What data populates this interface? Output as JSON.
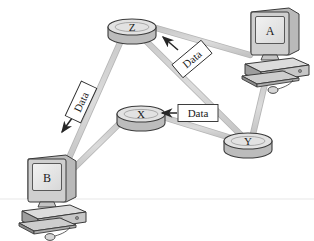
{
  "diagram": {
    "background_color": "#ffffff",
    "link_color": "#d2d2d2",
    "link_edge_color": "#b8b8b8",
    "outline_color": "#3a3a3a",
    "router_top_color": "#e0e0e0",
    "router_body_color": "#bcbcbc",
    "screen_color": "#e8e8e8",
    "case_color": "#d6d6d6",
    "case_shade_color": "#8e8e8e",
    "label_box_fill": "#ffffff",
    "label_text_color": "#1a1a1a",
    "arrow_color": "#262626"
  },
  "nodes": {
    "routers": [
      {
        "id": "router-z",
        "label": "Z",
        "cx": 132,
        "cy": 27,
        "rx": 24,
        "ry": 8,
        "depth": 9
      },
      {
        "id": "router-x",
        "label": "X",
        "cx": 141,
        "cy": 114,
        "rx": 24,
        "ry": 8,
        "depth": 9
      },
      {
        "id": "router-y",
        "label": "Y",
        "cx": 248,
        "cy": 141,
        "rx": 24,
        "ry": 8,
        "depth": 9
      }
    ],
    "computers": [
      {
        "id": "computer-a",
        "label": "A",
        "x": 243,
        "y": 8
      },
      {
        "id": "computer-b",
        "label": "B",
        "x": 20,
        "y": 155
      }
    ]
  },
  "links": [
    {
      "id": "link-z-a",
      "from": "router-z",
      "to": "computer-a",
      "x1": 156,
      "y1": 28,
      "x2": 248,
      "y2": 54
    },
    {
      "id": "link-z-y",
      "from": "router-z",
      "to": "router-y",
      "x1": 140,
      "y1": 36,
      "x2": 242,
      "y2": 137
    },
    {
      "id": "link-z-b",
      "from": "router-z",
      "to": "computer-b",
      "x1": 124,
      "y1": 36,
      "x2": 64,
      "y2": 166
    },
    {
      "id": "link-x-y",
      "from": "router-x",
      "to": "router-y",
      "x1": 164,
      "y1": 116,
      "x2": 230,
      "y2": 137
    },
    {
      "id": "link-x-b",
      "from": "router-x",
      "to": "computer-b",
      "x1": 122,
      "y1": 120,
      "x2": 70,
      "y2": 170
    },
    {
      "id": "link-a-y",
      "from": "computer-a",
      "to": "router-y",
      "x1": 265,
      "y1": 80,
      "x2": 252,
      "y2": 134
    }
  ],
  "data_labels": [
    {
      "id": "data-label-z-to-b",
      "text": "Data",
      "x": 81,
      "y": 102,
      "rotation": -65,
      "direction": "toward computer B",
      "arrow": {
        "x1": 74,
        "y1": 115,
        "x2": 62,
        "y2": 131
      }
    },
    {
      "id": "data-label-y-to-z",
      "text": "Data",
      "x": 190,
      "y": 58,
      "rotation": -40,
      "direction": "toward router Z",
      "arrow": {
        "x1": 176,
        "y1": 48,
        "x2": 162,
        "y2": 36
      }
    },
    {
      "id": "data-label-y-to-x",
      "text": "Data",
      "x": 196,
      "y": 113,
      "rotation": 0,
      "direction": "toward router X",
      "arrow": {
        "x1": 176,
        "y1": 113,
        "x2": 162,
        "y2": 113
      }
    }
  ],
  "ground_line": {
    "y": 199,
    "x1": 0,
    "x2": 314,
    "color": "#ededed"
  }
}
